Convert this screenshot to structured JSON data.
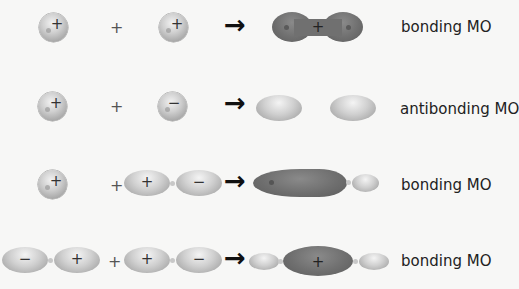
{
  "rows": [
    {
      "reactant_1": {
        "orbital": "s",
        "sign": "+"
      },
      "operator": "+",
      "reactant_2": {
        "orbital": "s",
        "sign": "+"
      },
      "arrow": "→",
      "product": {
        "shape": "dumbbell-dark",
        "sign": "+"
      },
      "label": "bonding MO"
    },
    {
      "reactant_1": {
        "orbital": "s",
        "sign": "+"
      },
      "operator": "+",
      "reactant_2": {
        "orbital": "s",
        "sign": "−"
      },
      "arrow": "→",
      "product": {
        "shape": "two-separate-light-lobes"
      },
      "label": "antibonding MO"
    },
    {
      "reactant_1": {
        "orbital": "s",
        "sign": "+"
      },
      "operator": "+",
      "reactant_2": {
        "orbital": "p",
        "lobes": [
          "+",
          "−"
        ]
      },
      "arrow": "→",
      "product": {
        "shape": "large-dark-lobe-plus-small-light-lobe"
      },
      "label": "bonding MO"
    },
    {
      "reactant_1": {
        "orbital": "p",
        "lobes": [
          "−",
          "+"
        ]
      },
      "operator": "+",
      "reactant_2": {
        "orbital": "p",
        "lobes": [
          "+",
          "−"
        ]
      },
      "arrow": "→",
      "product": {
        "shape": "small-light-dark-center-small-light",
        "sign": "+"
      },
      "label": "bonding MO"
    }
  ],
  "colors": {
    "background": "#f7f7f6",
    "light_lobe": "#c8c8c8",
    "dark_lobe": "#6f6f6f",
    "text": "#222222"
  }
}
